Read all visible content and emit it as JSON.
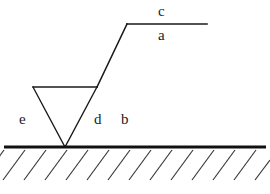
{
  "figure": {
    "background_color": "#ffffff",
    "stroke_color": "#1a1a1a",
    "ground_color": "#111111",
    "labels": [
      {
        "id": "c",
        "text": "c",
        "x": 163,
        "y": 11
      },
      {
        "id": "a",
        "text": "a",
        "x": 163,
        "y": 35
      },
      {
        "id": "e",
        "text": "e",
        "x": 24,
        "y": 119
      },
      {
        "id": "d",
        "text": "d",
        "x": 99,
        "y": 119
      },
      {
        "id": "b",
        "text": "b",
        "x": 126,
        "y": 119
      }
    ],
    "geometry": {
      "rod_horizontal": {
        "x1": 127,
        "y1": 24,
        "x2": 207,
        "y2": 24
      },
      "rod_diagonal": {
        "x1": 127,
        "y1": 24,
        "x2": 97,
        "y2": 87
      },
      "wedge_top": {
        "x1": 33,
        "y1": 87,
        "x2": 97,
        "y2": 87
      },
      "wedge_left": {
        "x1": 33,
        "y1": 87,
        "x2": 65,
        "y2": 147
      },
      "wedge_right": {
        "x1": 97,
        "y1": 87,
        "x2": 65,
        "y2": 147
      },
      "ground_line": {
        "x1": 4,
        "y1": 147,
        "x2": 266,
        "y2": 147
      },
      "hatch_count": 13,
      "hatch_spacing": 21,
      "hatch_length": 30,
      "hatch_angle_deg": 45
    }
  }
}
